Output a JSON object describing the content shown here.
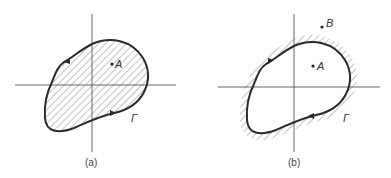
{
  "figure": {
    "panels": [
      {
        "id": "a",
        "caption": "(a)",
        "point_labels": [
          "A"
        ],
        "curve_label": "Γ",
        "shading": "interior",
        "orientation": "counterclockwise"
      },
      {
        "id": "b",
        "caption": "(b)",
        "point_labels": [
          "A",
          "B"
        ],
        "curve_label": "Γ",
        "shading": "exterior",
        "orientation": "clockwise"
      }
    ]
  },
  "colors": {
    "curve": "#2a2a2a",
    "axes": "#555555",
    "hatch": "#8a8a8a",
    "background": "#ffffff"
  }
}
